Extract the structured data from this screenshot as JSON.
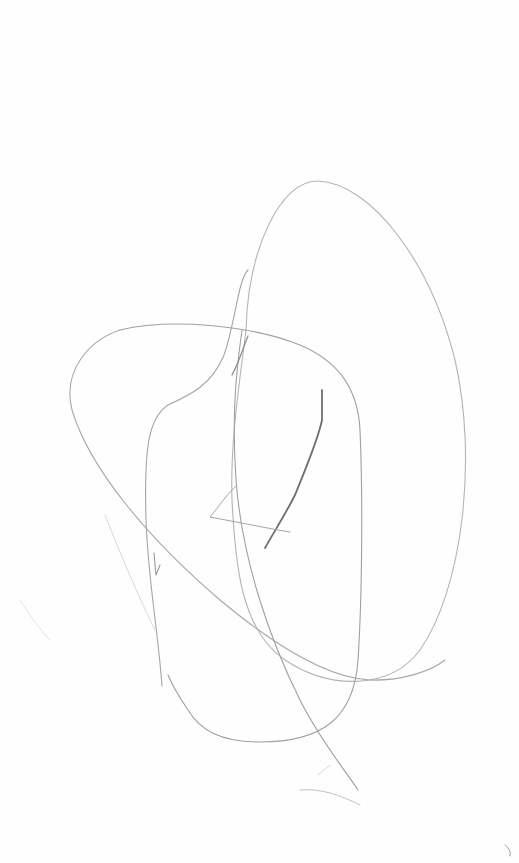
{
  "image": {
    "width": 519,
    "height": 863,
    "background": "#fefefe",
    "description": "Abstract pencil line drawing on white paper"
  },
  "strokes": [
    {
      "name": "tall-oval",
      "color": "#b4b4b4",
      "width": 1.1,
      "d": "M 246 330 C 248 250 280 180 318 181 C 370 183 430 260 455 360 C 478 460 462 590 420 650 C 390 690 330 690 285 660 C 240 630 235 560 232 500 C 230 440 240 380 246 330"
    },
    {
      "name": "wide-loop",
      "color": "#a8a8a8",
      "width": 1.1,
      "d": "M 120 330 C 90 340 62 370 72 410 C 90 470 150 540 220 600 C 280 650 330 678 370 680 C 400 681 430 672 445 660"
    },
    {
      "name": "wide-loop-top",
      "color": "#a0a0a0",
      "width": 1.1,
      "d": "M 120 330 C 170 318 250 325 300 345 C 340 362 358 390 360 430 C 363 500 362 600 358 660 C 354 720 320 742 260 742 C 220 742 200 730 188 710 C 178 695 172 685 168 675"
    },
    {
      "name": "left-vertical",
      "color": "#a6a6a6",
      "width": 1.1,
      "d": "M 248 270 C 238 280 236 320 224 355 C 212 385 190 395 168 405 C 148 418 144 450 146 520 C 148 580 158 630 162 686"
    },
    {
      "name": "left-hook",
      "color": "#9c9c9c",
      "width": 1.1,
      "d": "M 154 553 L 156 575 L 160 565"
    },
    {
      "name": "center-curve",
      "color": "#a0a0a0",
      "width": 1.1,
      "d": "M 242 330 C 235 380 232 420 236 480 C 242 560 270 640 300 700 C 320 740 345 770 358 790"
    },
    {
      "name": "dark-stroke",
      "color": "#6e6e6e",
      "width": 1.8,
      "d": "M 322 390 L 322 420 C 318 440 305 470 295 495 C 285 515 275 530 265 548"
    },
    {
      "name": "angle-stroke",
      "color": "#a4a4a4",
      "width": 1.0,
      "d": "M 236 486 C 226 495 218 508 210 517 L 278 530 L 290 532"
    },
    {
      "name": "neck-shade",
      "color": "#8e8e8e",
      "width": 1.3,
      "d": "M 248 336 C 244 345 240 360 232 375"
    },
    {
      "name": "faint-diagonal",
      "color": "#d8d8d8",
      "width": 1.0,
      "d": "M 105 515 C 115 540 135 590 155 630"
    },
    {
      "name": "faint-corner",
      "color": "#e2e2e2",
      "width": 1.0,
      "d": "M 20 600 C 30 615 40 630 50 640"
    },
    {
      "name": "bottom-flick",
      "color": "#c2c2c2",
      "width": 1.0,
      "d": "M 300 790 C 320 788 340 795 360 805"
    },
    {
      "name": "bottom-flick-2",
      "color": "#d2d2d2",
      "width": 1.0,
      "d": "M 318 775 L 330 765"
    },
    {
      "name": "corner-mark",
      "color": "#9a9a9a",
      "width": 1.0,
      "d": "M 505 845 C 509 848 511 852 510 856"
    }
  ]
}
